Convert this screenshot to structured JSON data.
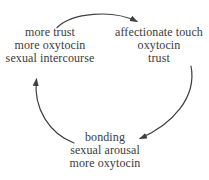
{
  "diagram": {
    "type": "cycle",
    "colors": {
      "background": "#ffffff",
      "text": "#3b3b3b",
      "arrow": "#3f3f3f"
    },
    "nodes": [
      {
        "id": "top-left",
        "lines": [
          "more trust",
          "more oxytocin",
          "sexual intercourse"
        ]
      },
      {
        "id": "top-right",
        "lines": [
          "affectionate touch",
          "oxytocin",
          "trust"
        ]
      },
      {
        "id": "bottom",
        "lines": [
          "bonding",
          "sexual arousal",
          "more oxytocin"
        ]
      }
    ],
    "edges": [
      {
        "from": "top-left",
        "to": "top-right",
        "shape": "arc-over-top"
      },
      {
        "from": "top-right",
        "to": "bottom",
        "shape": "arc-down-right-side"
      },
      {
        "from": "bottom",
        "to": "top-left",
        "shape": "arc-up-left-side"
      }
    ]
  }
}
